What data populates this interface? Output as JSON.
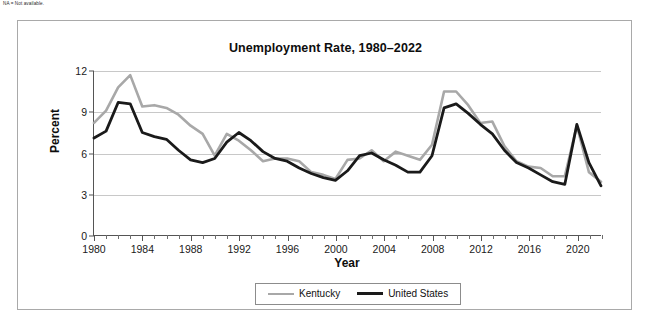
{
  "footnote": "NA = Not available.",
  "chart_data": {
    "type": "line",
    "title": "Unemployment Rate, 1980–2022",
    "xlabel": "Year",
    "ylabel": "Percent",
    "xlim": [
      1980,
      2022
    ],
    "ylim": [
      0,
      12
    ],
    "yticks": [
      0,
      3,
      6,
      9,
      12
    ],
    "xticks": [
      1980,
      1984,
      1988,
      1992,
      1996,
      2000,
      2004,
      2008,
      2012,
      2016,
      2020
    ],
    "xminor_step": 1,
    "grid": "horizontal",
    "legend_position": "bottom-center",
    "x": [
      1980,
      1981,
      1982,
      1983,
      1984,
      1985,
      1986,
      1987,
      1988,
      1989,
      1990,
      1991,
      1992,
      1993,
      1994,
      1995,
      1996,
      1997,
      1998,
      1999,
      2000,
      2001,
      2002,
      2003,
      2004,
      2005,
      2006,
      2007,
      2008,
      2009,
      2010,
      2011,
      2012,
      2013,
      2014,
      2015,
      2016,
      2017,
      2018,
      2019,
      2020,
      2021,
      2022
    ],
    "series": [
      {
        "name": "Kentucky",
        "color": "#a8a8a8",
        "values": [
          8.2,
          9.1,
          10.8,
          11.7,
          9.4,
          9.5,
          9.3,
          8.8,
          8.0,
          7.4,
          5.8,
          7.4,
          6.9,
          6.2,
          5.4,
          5.6,
          5.6,
          5.4,
          4.6,
          4.4,
          4.1,
          5.5,
          5.6,
          6.2,
          5.4,
          6.1,
          5.8,
          5.5,
          6.6,
          10.5,
          10.5,
          9.5,
          8.2,
          8.3,
          6.5,
          5.4,
          5.0,
          4.9,
          4.3,
          4.3,
          8.0,
          4.6,
          3.9
        ]
      },
      {
        "name": "United States",
        "color": "#1a1a1a",
        "values": [
          7.1,
          7.6,
          9.7,
          9.6,
          7.5,
          7.2,
          7.0,
          6.2,
          5.5,
          5.3,
          5.6,
          6.8,
          7.5,
          6.9,
          6.1,
          5.6,
          5.4,
          4.9,
          4.5,
          4.2,
          4.0,
          4.7,
          5.8,
          6.0,
          5.5,
          5.1,
          4.6,
          4.6,
          5.8,
          9.3,
          9.6,
          8.9,
          8.1,
          7.4,
          6.2,
          5.3,
          4.9,
          4.4,
          3.9,
          3.7,
          8.1,
          5.3,
          3.6
        ]
      }
    ]
  }
}
